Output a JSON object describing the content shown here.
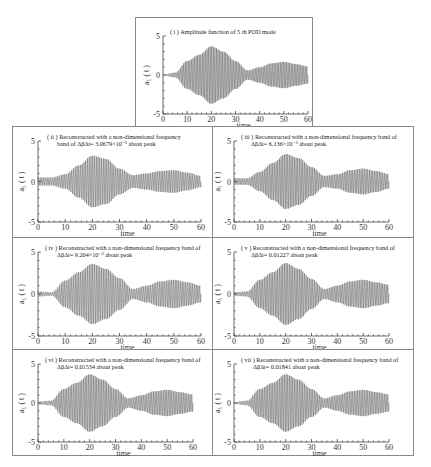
{
  "figure": {
    "panels": [
      {
        "id": "i",
        "title_line1": "( i ) Amplitude function of  5 th  POD mode",
        "title_line2": ""
      },
      {
        "id": "ii",
        "title_line1": "( ii )  Reconstructed with  a non-dimensional frequency",
        "title_line2": "band of  ΔβΔt= 3.0679×10⁻³  about peak"
      },
      {
        "id": "iii",
        "title_line1": "( iii )  Reconstructed with  a non-dimensional frequency band of",
        "title_line2": "ΔβΔt= 6.136×10⁻³  about peak"
      },
      {
        "id": "iv",
        "title_line1": "( iv )  Reconstructed with  a non-dimensional frequency band of",
        "title_line2": "ΔβΔt= 9.204×10⁻³  about peak"
      },
      {
        "id": "v",
        "title_line1": "( v )  Reconstructed with  a non-dimensional frequency band of",
        "title_line2": "ΔβΔt= 0.01227  about peak"
      },
      {
        "id": "vi",
        "title_line1": "( vi )  Reconstructed with  a non-dimensional frequency band of",
        "title_line2": "ΔβΔt= 0.01534  about peak"
      },
      {
        "id": "vii",
        "title_line1": "( vii )  Reconstructed with  a non-dimensional frequency band of",
        "title_line2": "ΔβΔt= 0.01841  about peak"
      }
    ],
    "xlabel": "time",
    "ylabel": "a₅ ( t )",
    "xticks": [
      "0",
      "10",
      "20",
      "30",
      "40",
      "50",
      "60"
    ],
    "yticks": [
      "5",
      "0",
      "-5"
    ],
    "signal_color": "#555555"
  },
  "chart_data": [
    {
      "type": "line",
      "title": "(i) Amplitude function of 5th POD mode",
      "xlabel": "time",
      "ylabel": "a5(t)",
      "xlim": [
        0,
        60
      ],
      "ylim": [
        -5,
        5
      ],
      "envelope": {
        "t": [
          0,
          5,
          10,
          15,
          20,
          25,
          30,
          35,
          40,
          45,
          50,
          55,
          60
        ],
        "amplitude": [
          0.05,
          0.3,
          1.8,
          2.6,
          3.7,
          3.0,
          1.8,
          0.6,
          1.0,
          1.5,
          1.7,
          1.4,
          1.1
        ]
      }
    },
    {
      "type": "line",
      "title": "(ii) Reconstructed, band 3.0679e-3",
      "xlabel": "time",
      "ylabel": "a5(t)",
      "xlim": [
        0,
        60
      ],
      "ylim": [
        -5,
        5
      ],
      "envelope": {
        "t": [
          0,
          5,
          10,
          15,
          20,
          25,
          30,
          35,
          40,
          45,
          50,
          55,
          60
        ],
        "amplitude": [
          0.5,
          0.5,
          0.9,
          2.0,
          3.2,
          2.8,
          1.6,
          0.8,
          1.0,
          1.3,
          1.4,
          1.1,
          0.7
        ]
      }
    },
    {
      "type": "line",
      "title": "(iii) Reconstructed, band 6.136e-3",
      "xlabel": "time",
      "ylabel": "a5(t)",
      "xlim": [
        0,
        60
      ],
      "ylim": [
        -5,
        5
      ],
      "envelope": {
        "t": [
          0,
          5,
          10,
          15,
          20,
          25,
          30,
          35,
          40,
          45,
          50,
          55,
          60
        ],
        "amplitude": [
          0.4,
          0.4,
          1.2,
          2.3,
          3.4,
          2.9,
          1.8,
          0.7,
          0.9,
          1.4,
          1.6,
          1.3,
          0.9
        ]
      }
    },
    {
      "type": "line",
      "title": "(iv) Reconstructed, band 9.204e-3",
      "xlabel": "time",
      "ylabel": "a5(t)",
      "xlim": [
        0,
        60
      ],
      "ylim": [
        -5,
        5
      ],
      "envelope": {
        "t": [
          0,
          5,
          10,
          15,
          20,
          25,
          30,
          35,
          40,
          45,
          50,
          55,
          60
        ],
        "amplitude": [
          0.3,
          0.2,
          1.6,
          2.6,
          3.6,
          3.0,
          1.9,
          0.6,
          1.0,
          1.5,
          1.7,
          1.4,
          1.0
        ]
      }
    },
    {
      "type": "line",
      "title": "(v) Reconstructed, band 0.01227",
      "xlabel": "time",
      "ylabel": "a5(t)",
      "xlim": [
        0,
        60
      ],
      "ylim": [
        -5,
        5
      ],
      "envelope": {
        "t": [
          0,
          5,
          10,
          15,
          20,
          25,
          30,
          35,
          40,
          45,
          50,
          55,
          60
        ],
        "amplitude": [
          0.2,
          0.3,
          1.7,
          2.6,
          3.7,
          3.0,
          1.8,
          0.6,
          1.0,
          1.5,
          1.7,
          1.4,
          1.1
        ]
      }
    },
    {
      "type": "line",
      "title": "(vi) Reconstructed, band 0.01534",
      "xlabel": "time",
      "ylabel": "a5(t)",
      "xlim": [
        0,
        60
      ],
      "ylim": [
        -5,
        5
      ],
      "envelope": {
        "t": [
          0,
          5,
          10,
          15,
          20,
          25,
          30,
          35,
          40,
          45,
          50,
          55,
          60
        ],
        "amplitude": [
          0.15,
          0.3,
          1.8,
          2.6,
          3.7,
          3.0,
          1.8,
          0.6,
          1.0,
          1.5,
          1.7,
          1.4,
          1.1
        ]
      }
    },
    {
      "type": "line",
      "title": "(vii) Reconstructed, band 0.01841",
      "xlabel": "time",
      "ylabel": "a5(t)",
      "xlim": [
        0,
        60
      ],
      "ylim": [
        -5,
        5
      ],
      "envelope": {
        "t": [
          0,
          5,
          10,
          15,
          20,
          25,
          30,
          35,
          40,
          45,
          50,
          55,
          60
        ],
        "amplitude": [
          0.1,
          0.3,
          1.8,
          2.6,
          3.7,
          3.0,
          1.8,
          0.6,
          1.0,
          1.5,
          1.7,
          1.4,
          1.1
        ]
      }
    }
  ]
}
